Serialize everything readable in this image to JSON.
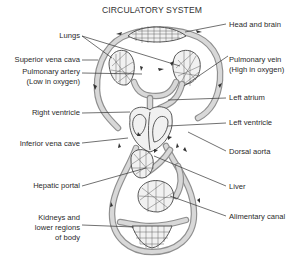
{
  "title": "CIRCULATORY SYSTEM",
  "labels": {
    "head_and_brain": "Head and brain",
    "lungs": "Lungs",
    "superior_vena_cava": "Superior vena cava",
    "pulmonary_artery": "Pulmonary artery",
    "pulmonary_artery_note": "(Low in oxygen)",
    "pulmonary_vein": "Pulmonary vein",
    "pulmonary_vein_note": "(High in oxygen)",
    "left_atrium": "Left atrium",
    "right_ventricle": "Right ventricle",
    "left_ventricle": "Left ventricle",
    "inferior_vena_cava": "Inferior vena cave",
    "dorsal_aorta": "Dorsal aorta",
    "hepatic_portal": "Hepatic portal",
    "liver": "Liver",
    "alimentary_canal": "Alimentary canal",
    "kidneys_line1": "Kidneys and",
    "kidneys_line2": "lower regions",
    "kidneys_line3": "of body"
  },
  "colors": {
    "vessel": "#8f8f8f",
    "vessel_inner": "#d8d8d8",
    "line": "#333333",
    "background": "#ffffff"
  }
}
